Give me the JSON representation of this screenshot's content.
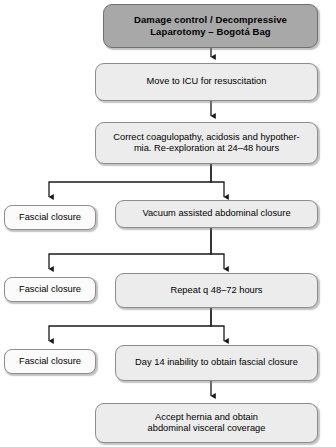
{
  "diagram": {
    "type": "flowchart",
    "background_color": "#ffffff",
    "colors": {
      "header_fill": "#a8a8a8",
      "step_fill": "#ececec",
      "terminal_fill": "#fbfbfb",
      "border": "#8d8d8d",
      "connector": "#1a1a1a",
      "text": "#000000"
    },
    "nodes": [
      {
        "id": "damage-control",
        "label": "Damage control / Decompressive\nLaparotomy – Bogotá Bag",
        "style": "header"
      },
      {
        "id": "move-to-icu",
        "label": "Move to ICU for resuscitation",
        "style": "step"
      },
      {
        "id": "correct-coagulopathy",
        "label": "Correct coagulopathy, acidosis and hypother-\nmia. Re-exploration at 24–48 hours",
        "style": "step"
      },
      {
        "id": "fascial-closure-1",
        "label": "Fascial closure",
        "style": "terminal"
      },
      {
        "id": "vacuum-assisted",
        "label": "Vacuum assisted abdominal closure",
        "style": "step"
      },
      {
        "id": "fascial-closure-2",
        "label": "Fascial closure",
        "style": "terminal"
      },
      {
        "id": "repeat-q48",
        "label": "Repeat q 48–72 hours",
        "style": "step"
      },
      {
        "id": "fascial-closure-3",
        "label": "Fascial closure",
        "style": "terminal"
      },
      {
        "id": "day-14",
        "label": "Day 14 inability to obtain fascial closure",
        "style": "step"
      },
      {
        "id": "accept-hernia",
        "label": "Accept hernia and obtain\nabdominal visceral coverage",
        "style": "step"
      }
    ]
  }
}
